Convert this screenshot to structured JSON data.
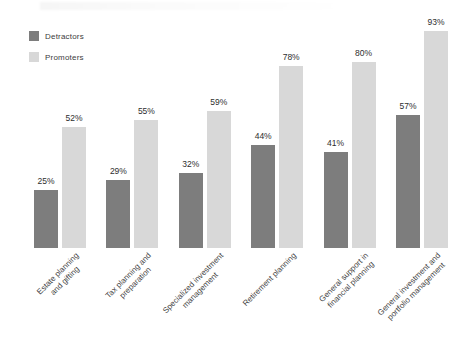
{
  "figure": {
    "background": "#ffffff"
  },
  "chart_data": {
    "type": "bar",
    "title": "",
    "xlabel": "",
    "ylabel": "",
    "ylim": [
      0,
      100
    ],
    "grid": false,
    "axis_lines": false,
    "legend_position": "top-left",
    "value_suffix": "%",
    "categories": [
      "Estate planning and gifting",
      "Tax planning and preparation",
      "Specialized investment management",
      "Retirement planning",
      "General support in financial planning",
      "General investment and portfolio management"
    ],
    "category_label_lines": [
      [
        "Estate planning",
        "and gifting"
      ],
      [
        "Tax planning and",
        "preparation"
      ],
      [
        "Specialized investment",
        "management"
      ],
      [
        "Retirement planning"
      ],
      [
        "General support in",
        "financial planning"
      ],
      [
        "General investment and",
        "portfolio management"
      ]
    ],
    "series": [
      {
        "name": "Detractors",
        "color": "#7d7d7d",
        "values": [
          25,
          29,
          32,
          44,
          41,
          57
        ]
      },
      {
        "name": "Promoters",
        "color": "#d8d8d8",
        "values": [
          52,
          55,
          59,
          78,
          80,
          93
        ]
      }
    ]
  }
}
